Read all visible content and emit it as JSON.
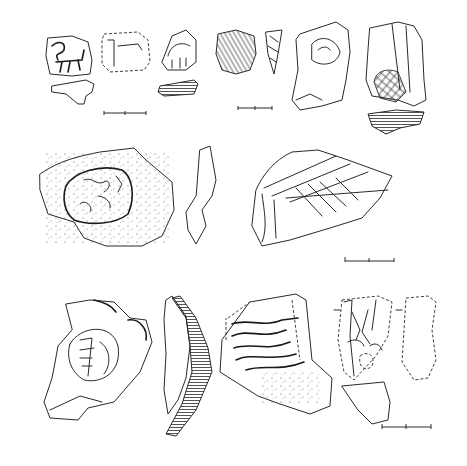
{
  "figure": {
    "type": "archaeological-drawing-plate",
    "background": "#ffffff",
    "ink_color": "#2a2a2a",
    "rows": [
      {
        "row": "top",
        "items": [
          {
            "id": "sherd-1",
            "description": "stamped sherd with animal motif",
            "profile": "section below"
          },
          {
            "id": "sherd-2",
            "description": "dashed-outline reconstructed sherd"
          },
          {
            "id": "sherd-3",
            "description": "triangular sherd with incised arches",
            "profile": "hatched section below"
          },
          {
            "id": "sherd-4",
            "description": "sherd with diagonal hatching"
          },
          {
            "id": "sherd-5",
            "description": "narrow pointed fragment"
          },
          {
            "id": "sherd-6",
            "description": "sherd with incised circle and lines"
          },
          {
            "id": "sherd-7",
            "description": "sherd with cross-hatched lozenge",
            "profile": "hatched section below"
          }
        ],
        "scale_bars": 2
      },
      {
        "row": "middle",
        "items": [
          {
            "id": "sherd-8",
            "description": "large sherd with stamped animal panel, stippled surface"
          },
          {
            "id": "sherd-9",
            "description": "rim profile"
          },
          {
            "id": "sherd-10",
            "description": "sherd with chevron/herringbone grooves"
          }
        ],
        "scale_bars": 1
      },
      {
        "row": "bottom",
        "items": [
          {
            "id": "sherd-11",
            "description": "sherd with stamped figural panel"
          },
          {
            "id": "sherd-12",
            "description": "curved vessel profile with hatched section"
          },
          {
            "id": "sherd-13",
            "description": "sherd with wavy incised bands"
          },
          {
            "id": "sherd-14",
            "description": "sherd with leaf motif",
            "profile": "side view and section"
          }
        ],
        "scale_bars": 1
      }
    ]
  }
}
